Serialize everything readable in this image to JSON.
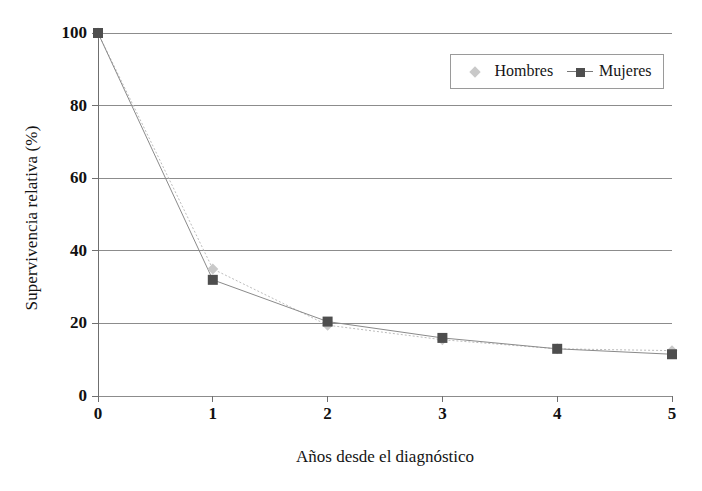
{
  "chart_data": {
    "type": "line",
    "title": "",
    "subtitle": "",
    "xlabel": "Años desde el diagnóstico",
    "ylabel": "Supervivencia relativa (%)",
    "x": [
      0,
      1,
      2,
      3,
      4,
      5
    ],
    "xticklabels": [
      "0",
      "1",
      "2",
      "3",
      "4",
      "5"
    ],
    "yticks": [
      0,
      20,
      40,
      60,
      80,
      100
    ],
    "yticklabels": [
      "0",
      "20",
      "40",
      "60",
      "80",
      "100"
    ],
    "xlim": [
      0,
      5
    ],
    "ylim": [
      0,
      100
    ],
    "grid": "horizontal",
    "legend_position": "top-right-inside",
    "series": [
      {
        "name": "Hombres",
        "marker": "diamond",
        "color": "#c9c9c9",
        "line_style": "dotted",
        "values": [
          100,
          35,
          19.5,
          15.5,
          13,
          12.5
        ]
      },
      {
        "name": "Mujeres",
        "marker": "square",
        "color": "#4e4e4e",
        "line_style": "solid",
        "values": [
          100,
          32,
          20.5,
          16,
          13,
          11.5
        ]
      }
    ]
  },
  "legend": {
    "entries": [
      {
        "label": "Hombres"
      },
      {
        "label": "Mujeres"
      }
    ]
  },
  "colors": {
    "hombres": "#c9c9c9",
    "mujeres": "#4e4e4e",
    "gridline": "#8c8c8c",
    "axis": "#6f6f6f",
    "text": "#141414"
  }
}
